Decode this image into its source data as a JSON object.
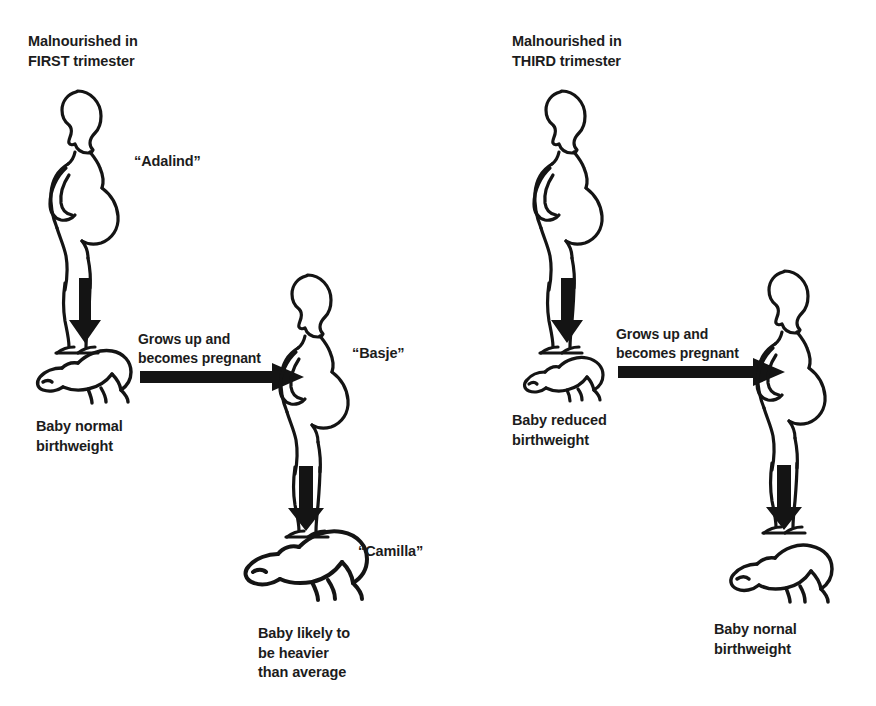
{
  "diagram": {
    "type": "flow-diagram",
    "stroke_color": "#141414",
    "background_color": "#ffffff",
    "panels": [
      {
        "id": "first-trimester",
        "heading": "Malnourished in\nFIRST trimester",
        "generation_1": {
          "figure": "pregnant-woman",
          "name": "“Adalind”"
        },
        "arrow_1": {
          "direction": "down",
          "label": ""
        },
        "generation_2_baby": {
          "figure": "crawling-baby",
          "size": "normal",
          "caption": "Baby normal\nbirthweight"
        },
        "arrow_2": {
          "direction": "right",
          "label": "Grows up and\nbecomes pregnant"
        },
        "generation_2_adult": {
          "figure": "pregnant-woman",
          "name": "“Basje”"
        },
        "arrow_3": {
          "direction": "down",
          "label": ""
        },
        "generation_3_baby": {
          "figure": "crawling-baby",
          "size": "large",
          "name": "“Camilla”",
          "caption": "Baby likely to\nbe heavier\nthan average"
        }
      },
      {
        "id": "third-trimester",
        "heading": "Malnourished in\nTHIRD trimester",
        "generation_1": {
          "figure": "pregnant-woman",
          "name": ""
        },
        "arrow_1": {
          "direction": "down",
          "label": ""
        },
        "generation_2_baby": {
          "figure": "crawling-baby",
          "size": "small",
          "caption": "Baby reduced\nbirthweight"
        },
        "arrow_2": {
          "direction": "right",
          "label": "Grows up and\nbecomes pregnant"
        },
        "generation_2_adult": {
          "figure": "pregnant-woman",
          "name": ""
        },
        "arrow_3": {
          "direction": "down",
          "label": ""
        },
        "generation_3_baby": {
          "figure": "crawling-baby",
          "size": "normal",
          "name": "",
          "caption": "Baby nornal\nbirthweight"
        }
      }
    ]
  }
}
